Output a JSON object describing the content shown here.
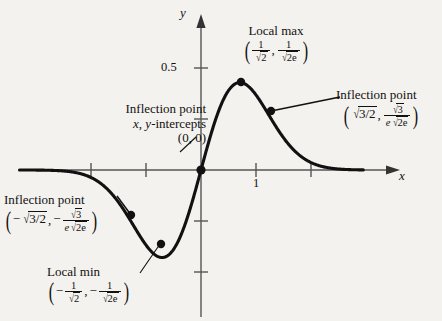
{
  "figure": {
    "title_present": false,
    "background_color": "#f4f2ee",
    "ink_color": "#111111",
    "curve_color": "#111111"
  },
  "axes": {
    "x_label": "x",
    "y_label": "y",
    "y_ticks_labeled": [
      "0.5"
    ],
    "x_ticks_labeled": [
      "1"
    ],
    "origin_label": "(0, 0)"
  },
  "annotations": {
    "local_max": {
      "title": "Local max",
      "x_num": "1",
      "x_den_radicand": "2",
      "y_num": "1",
      "y_den_radicand": "2e"
    },
    "local_min": {
      "title": "Local min",
      "x_num": "1",
      "x_den_radicand": "2",
      "y_num": "1",
      "y_den_radicand": "2e",
      "x_sign": "−",
      "y_sign": "−"
    },
    "inflection_right": {
      "title": "Inflection point",
      "x_radicand": "3/2",
      "y_num_radicand": "3",
      "y_den_lead": "e",
      "y_den_radicand": "2e"
    },
    "inflection_left": {
      "title": "Inflection point",
      "x_sign": "−",
      "x_radicand": "3/2",
      "y_sign": "−",
      "y_num_radicand": "3",
      "y_den_lead": "e",
      "y_den_radicand": "2e"
    },
    "inflection_origin": {
      "line1": "Inflection point",
      "line2_a": "x",
      "line2_b": ", ",
      "line2_c": "y",
      "line2_d": "-intercepts",
      "line3": "(0, 0)"
    }
  },
  "chart_data": {
    "type": "line",
    "title": "",
    "xlabel": "x",
    "ylabel": "y",
    "function": "y = x * exp(-x^2)",
    "xlim": [
      -3.3,
      2.95
    ],
    "ylim": [
      -0.72,
      0.78
    ],
    "x_ticks": [
      1,
      2
    ],
    "x_tick_labels": [
      "1",
      ""
    ],
    "y_ticks": [
      0.5,
      0.25,
      -0.25,
      -0.5
    ],
    "y_tick_labels": [
      "0.5",
      "",
      "",
      ""
    ],
    "grid": false,
    "legend": false,
    "points": [
      {
        "name": "local-max",
        "x": 0.7071,
        "y": 0.4289,
        "label": "Local max"
      },
      {
        "name": "local-min",
        "x": -0.7071,
        "y": -0.4289,
        "label": "Local min"
      },
      {
        "name": "inflection-right",
        "x": 1.2247,
        "y": 0.274,
        "label": "Inflection point"
      },
      {
        "name": "inflection-left",
        "x": -1.2247,
        "y": -0.274,
        "label": "Inflection point"
      },
      {
        "name": "inflection-origin",
        "x": 0,
        "y": 0,
        "label": "Inflection point / x, y-intercepts"
      }
    ]
  }
}
